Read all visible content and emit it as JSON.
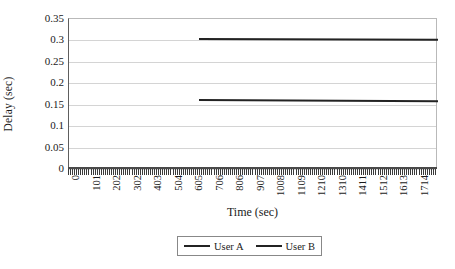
{
  "chart_data": {
    "type": "line",
    "title": "",
    "xlabel": "Time (sec)",
    "ylabel": "Delay (sec)",
    "xlim": [
      0,
      1815
    ],
    "ylim": [
      0,
      0.35
    ],
    "grid": true,
    "legend_position": "bottom",
    "x_tick_labels": [
      "0",
      "101",
      "202",
      "302",
      "403",
      "504",
      "605",
      "706",
      "806",
      "907",
      "1008",
      "1109",
      "1210",
      "1310",
      "1411",
      "1512",
      "1613",
      "1714"
    ],
    "y_tick_labels": [
      "0",
      "0.05",
      "0.1",
      "0.15",
      "0.2",
      "0.25",
      "0.3",
      "0.35"
    ],
    "y_tick_values": [
      0,
      0.05,
      0.1,
      0.15,
      0.2,
      0.25,
      0.3,
      0.35
    ],
    "series": [
      {
        "name": "User A",
        "color": "#232323",
        "x": [
          640,
          1815
        ],
        "values": [
          0.305,
          0.303
        ],
        "start_x": 640,
        "end_x": 1815
      },
      {
        "name": "User B",
        "color": "#232323",
        "x": [
          640,
          1815
        ],
        "values": [
          0.163,
          0.16
        ],
        "start_x": 640,
        "end_x": 1815
      }
    ],
    "legend": [
      {
        "label": "User A",
        "color": "#232323"
      },
      {
        "label": "User B",
        "color": "#232323"
      }
    ]
  },
  "axes": {
    "y_title": "Delay (sec)",
    "x_title": "Time (sec)"
  },
  "colors": {
    "line": "#232323",
    "gridline": "#d4d4d4",
    "axis": "#4a4a4a",
    "background": "#ffffff"
  }
}
